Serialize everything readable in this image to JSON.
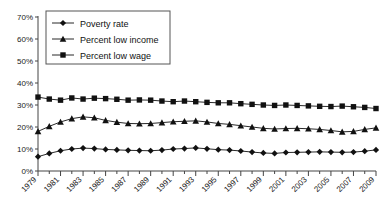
{
  "chart_data": {
    "type": "line",
    "title": "",
    "xlabel": "",
    "ylabel": "",
    "ylim": [
      0,
      70
    ],
    "ytick_labels": [
      "0%",
      "10%",
      "20%",
      "30%",
      "40%",
      "50%",
      "60%",
      "70%"
    ],
    "ytick_values": [
      0,
      10,
      20,
      30,
      40,
      50,
      60,
      70
    ],
    "xlim": [
      1979,
      2009
    ],
    "x": [
      1979,
      1980,
      1981,
      1982,
      1983,
      1984,
      1985,
      1986,
      1987,
      1988,
      1989,
      1990,
      1991,
      1992,
      1993,
      1994,
      1995,
      1996,
      1997,
      1998,
      1999,
      2000,
      2001,
      2002,
      2003,
      2004,
      2005,
      2006,
      2007,
      2008,
      2009
    ],
    "xtick_labels": [
      "1979",
      "1981",
      "1983",
      "1985",
      "1987",
      "1989",
      "1991",
      "1993",
      "1995",
      "1997",
      "1999",
      "2001",
      "2003",
      "2005",
      "2007",
      "2009"
    ],
    "xtick_values": [
      1979,
      1981,
      1983,
      1985,
      1987,
      1989,
      1991,
      1993,
      1995,
      1997,
      1999,
      2001,
      2003,
      2005,
      2007,
      2009
    ],
    "grid": false,
    "legend_position": "top-left",
    "series": [
      {
        "name": "Poverty rate",
        "marker": "diamond",
        "values": [
          6.5,
          8.0,
          9.2,
          10.0,
          10.4,
          10.2,
          9.8,
          9.6,
          9.4,
          9.3,
          9.2,
          9.5,
          10.0,
          10.2,
          10.5,
          10.1,
          9.7,
          9.5,
          9.1,
          8.6,
          8.2,
          8.0,
          8.4,
          8.5,
          8.6,
          8.7,
          8.6,
          8.5,
          8.6,
          9.0,
          9.6
        ]
      },
      {
        "name": "Percent low income",
        "marker": "triangle",
        "values": [
          18.0,
          20.3,
          22.3,
          23.8,
          24.6,
          24.2,
          23.0,
          22.2,
          21.6,
          21.5,
          21.6,
          22.0,
          22.4,
          22.6,
          22.8,
          22.3,
          21.6,
          21.2,
          20.6,
          20.0,
          19.4,
          19.1,
          19.3,
          19.4,
          19.2,
          18.9,
          18.4,
          17.8,
          18.0,
          18.9,
          19.6
        ]
      },
      {
        "name": "Percent low wage",
        "marker": "square",
        "values": [
          33.6,
          32.7,
          32.2,
          33.2,
          32.7,
          33.1,
          32.9,
          32.6,
          32.2,
          32.3,
          32.2,
          31.8,
          31.5,
          31.8,
          31.5,
          31.2,
          31.0,
          31.0,
          30.6,
          30.3,
          30.0,
          29.8,
          30.0,
          29.8,
          29.6,
          29.4,
          29.3,
          29.5,
          29.2,
          28.9,
          28.4
        ]
      }
    ]
  }
}
